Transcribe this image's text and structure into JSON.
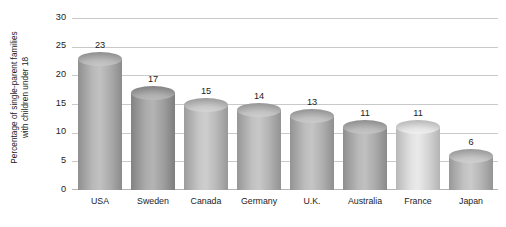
{
  "chart_data": {
    "type": "bar",
    "title": "",
    "xlabel": "",
    "ylabel": "Percentage of single-parent families with children under 18",
    "ylabel_lines": [
      "Percentage of single-parent families",
      "with children under 18"
    ],
    "categories": [
      "USA",
      "Sweden",
      "Canada",
      "Germany",
      "U.K.",
      "Australia",
      "France",
      "Japan"
    ],
    "values": [
      23,
      17,
      15,
      14,
      13,
      11,
      11,
      6
    ],
    "value_labels": [
      "23",
      "17",
      "15",
      "14",
      "13",
      "11",
      "11",
      "6"
    ],
    "ylim": [
      0,
      30
    ],
    "yticks": [
      0,
      5,
      10,
      15,
      20,
      25,
      30
    ],
    "ytick_labels": [
      "0",
      "5",
      "10",
      "15",
      "20",
      "25",
      "30"
    ],
    "grid": true,
    "legend": "none",
    "bar_style": "cylinder-3d",
    "bar_colors": [
      "#a9a9a9",
      "#9c9c9c",
      "#b6b6b6",
      "#b0b0b0",
      "#adadad",
      "#a8a8a8",
      "#d2d2d2",
      "#b2b2b2"
    ],
    "colors": {
      "background": "#ffffff",
      "gridline": "#c9c9c9",
      "baseline": "#b4b4b4",
      "text": "#1c1c1c"
    }
  }
}
